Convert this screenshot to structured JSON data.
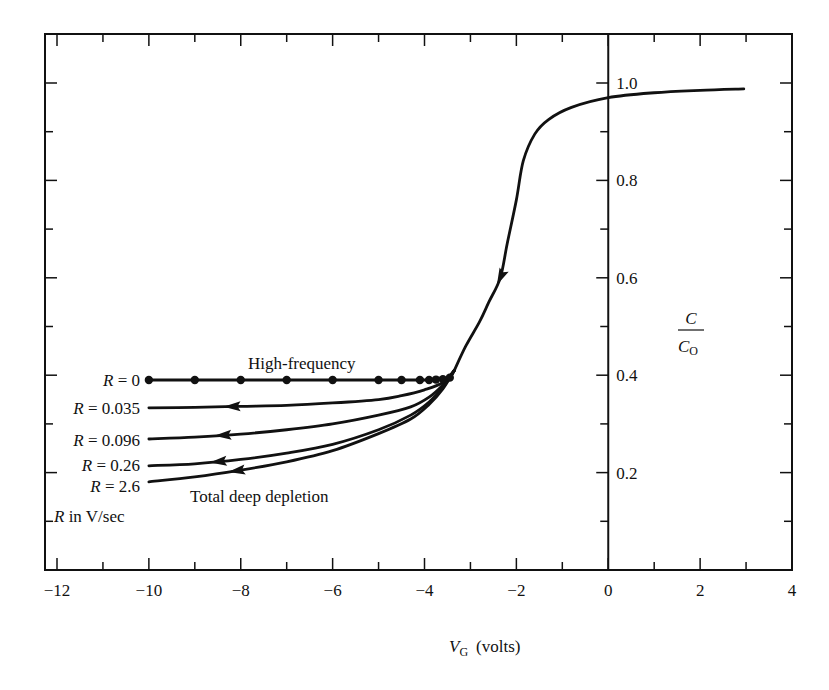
{
  "chart_data": {
    "type": "line",
    "title": "",
    "xlabel": "V_G (volts)",
    "xlabel_main": "V",
    "xlabel_sub": "G",
    "xlabel_unit": "(volts)",
    "ylabel": "C/C_O",
    "ylabel_num": "C",
    "ylabel_den": "C",
    "ylabel_den_sub": "O",
    "xlim": [
      -12,
      4
    ],
    "ylim": [
      0,
      1.0
    ],
    "x_ticks": [
      -12,
      -10,
      -8,
      -6,
      -4,
      -2,
      0,
      2,
      4
    ],
    "x_tick_labels": [
      "−12",
      "−10",
      "−8",
      "−6",
      "−4",
      "−2",
      "0",
      "2",
      "4"
    ],
    "x_minor_step": 1,
    "y_ticks": [
      0.2,
      0.4,
      0.6,
      0.8,
      1.0
    ],
    "y_tick_labels": [
      "0.2",
      "0.4",
      "0.6",
      "0.8",
      "1.0"
    ],
    "y_minor_step": 0.1,
    "grid": false,
    "legend": "none (inline labels)",
    "y_axis_position": "x = 0",
    "series": [
      {
        "name": "Accumulation / depletion (common)",
        "x": [
          2.95,
          2.0,
          1.0,
          0.0,
          -0.8,
          -1.3,
          -1.6,
          -1.85,
          -2.0,
          -2.2,
          -2.35,
          -2.6,
          -2.8,
          -3.1,
          -3.35
        ],
        "y": [
          0.988,
          0.985,
          0.98,
          0.97,
          0.95,
          0.925,
          0.895,
          0.84,
          0.76,
          0.67,
          0.6,
          0.55,
          0.51,
          0.46,
          0.41
        ],
        "arrow_at_index": 10
      },
      {
        "name": "High-frequency",
        "label": "R = 0",
        "x": [
          -3.35,
          -3.45,
          -3.6,
          -3.75,
          -3.9,
          -4.1,
          -4.5,
          -5,
          -6,
          -7,
          -8,
          -9,
          -10
        ],
        "y": [
          0.41,
          0.395,
          0.392,
          0.391,
          0.39,
          0.39,
          0.39,
          0.39,
          0.39,
          0.39,
          0.39,
          0.39,
          0.39
        ],
        "markers": true
      },
      {
        "name": "R = 0.035",
        "label": "R = 0.035",
        "x": [
          -3.35,
          -3.6,
          -4.0,
          -4.5,
          -5.0,
          -6.0,
          -7.0,
          -8.0,
          -9.0,
          -10.0
        ],
        "y": [
          0.41,
          0.385,
          0.37,
          0.358,
          0.35,
          0.343,
          0.338,
          0.336,
          0.334,
          0.333
        ],
        "arrow_x": -8.2
      },
      {
        "name": "R = 0.096",
        "label": "R = 0.096",
        "x": [
          -3.35,
          -3.6,
          -3.9,
          -4.3,
          -5.0,
          -6.0,
          -7.0,
          -8.0,
          -9.0,
          -10.0
        ],
        "y": [
          0.41,
          0.38,
          0.355,
          0.335,
          0.318,
          0.3,
          0.288,
          0.279,
          0.273,
          0.269
        ],
        "arrow_x": -8.4
      },
      {
        "name": "R = 0.26",
        "label": "R = 0.26",
        "x": [
          -3.35,
          -3.6,
          -3.9,
          -4.3,
          -5.0,
          -6.0,
          -7.0,
          -8.0,
          -9.0,
          -10.0
        ],
        "y": [
          0.41,
          0.375,
          0.345,
          0.318,
          0.288,
          0.258,
          0.24,
          0.227,
          0.218,
          0.214
        ],
        "arrow_x": -8.5
      },
      {
        "name": "R = 2.6 (Total deep depletion)",
        "label": "R = 2.6",
        "x": [
          -3.35,
          -3.6,
          -3.9,
          -4.3,
          -5.0,
          -6.0,
          -7.0,
          -8.0,
          -9.0,
          -10.0
        ],
        "y": [
          0.41,
          0.372,
          0.34,
          0.31,
          0.28,
          0.245,
          0.222,
          0.205,
          0.191,
          0.181
        ],
        "arrow_x": -8.1
      }
    ],
    "annotations": [
      {
        "text": "High-frequency",
        "x": -6.7,
        "y": 0.41
      },
      {
        "text": "Total deep depletion",
        "x": -7.25,
        "y": 0.155
      },
      {
        "text": "R in V/sec",
        "x": -12.3,
        "y": 0.115
      }
    ]
  },
  "labels": {
    "r0": "R = 0",
    "r1": "R = 0.035",
    "r2": "R = 0.096",
    "r3": "R = 0.26",
    "r4": "R = 2.6",
    "r_units_italic": "R",
    "r_units_rest": " in V/sec",
    "high_frequency": "High-frequency",
    "deep_depletion": "Total deep depletion"
  },
  "colors": {
    "ink": "#111111",
    "background": "#ffffff"
  }
}
